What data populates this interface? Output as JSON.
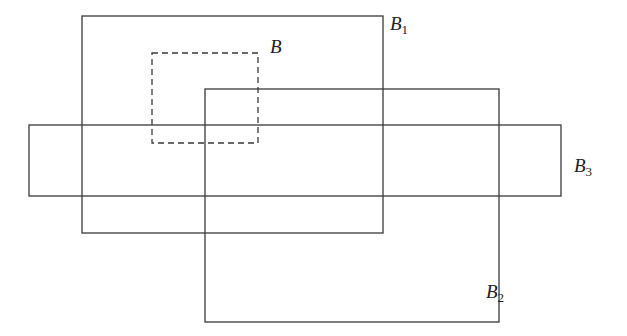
{
  "diagram": {
    "type": "overlapping-rectangles",
    "stroke_color": "#3a3a3a",
    "boxes": [
      {
        "id": "B1",
        "name": "B",
        "sub": "1",
        "style": "solid",
        "x": 82,
        "y": 16,
        "w": 301,
        "h": 217,
        "label_x": 390,
        "label_y": 14
      },
      {
        "id": "B2",
        "name": "B",
        "sub": "2",
        "style": "solid",
        "x": 205,
        "y": 89,
        "w": 294,
        "h": 233,
        "label_x": 486,
        "label_y": 282
      },
      {
        "id": "B3",
        "name": "B",
        "sub": "3",
        "style": "solid",
        "x": 29,
        "y": 125,
        "w": 532,
        "h": 71,
        "label_x": 574,
        "label_y": 156
      },
      {
        "id": "B",
        "name": "B",
        "sub": "",
        "style": "dashed",
        "x": 152,
        "y": 53,
        "w": 106,
        "h": 90,
        "label_x": 270,
        "label_y": 37
      }
    ]
  }
}
